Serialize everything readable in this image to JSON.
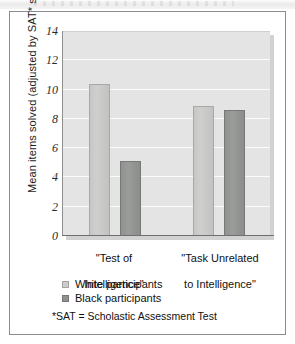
{
  "figure": {
    "background_color": "#ffffff",
    "frame_color": "#8b8c8e"
  },
  "chart_data": {
    "type": "bar",
    "title": "",
    "xlabel": "",
    "ylabel": "Mean items solved (adjusted by SAT* score)",
    "categories": [
      "\"Test of\nIntelligence\"",
      "\"Task Unrelated\nto Intelligence\""
    ],
    "series": [
      {
        "name": "White participants",
        "color": "#cccdcb",
        "values": [
          10.4,
          8.9
        ]
      },
      {
        "name": "Black participants",
        "color": "#8f918f",
        "values": [
          5.1,
          8.6
        ]
      }
    ],
    "ylim": [
      0,
      14
    ],
    "yticks": [
      0,
      2,
      4,
      6,
      8,
      10,
      12,
      14
    ],
    "ytick_labels": [
      "0",
      "2",
      "4",
      "6",
      "8",
      "10",
      "12",
      "14"
    ],
    "grid": true,
    "grid_color": "#fbfbfb",
    "plot_background": "#e4e4e4",
    "legend_position": "below-axis-left"
  },
  "axis": {
    "ticks": [
      {
        "label": "14",
        "value": 14
      },
      {
        "label": "12",
        "value": 12
      },
      {
        "label": "10",
        "value": 10
      },
      {
        "label": "8",
        "value": 8
      },
      {
        "label": "6",
        "value": 6
      },
      {
        "label": "4",
        "value": 4
      },
      {
        "label": "2",
        "value": 2
      },
      {
        "label": "0",
        "value": 0
      }
    ],
    "y_title": "Mean items solved (adjusted by SAT* score)"
  },
  "groups": [
    {
      "label_line1": "\"Test of",
      "label_line2": "Intelligence\"",
      "bars": [
        {
          "series": "White participants",
          "value": 10.4,
          "style": "light"
        },
        {
          "series": "Black participants",
          "value": 5.1,
          "style": "dark"
        }
      ]
    },
    {
      "label_line1": "\"Task Unrelated",
      "label_line2": "to Intelligence\"",
      "bars": [
        {
          "series": "White participants",
          "value": 8.9,
          "style": "light"
        },
        {
          "series": "Black participants",
          "value": 8.6,
          "style": "dark"
        }
      ]
    }
  ],
  "legend": {
    "items": [
      {
        "label": "White participants",
        "style": "light"
      },
      {
        "label": "Black participants",
        "style": "dark"
      }
    ]
  },
  "footnote": {
    "text": "*SAT = Scholastic Assessment Test"
  }
}
